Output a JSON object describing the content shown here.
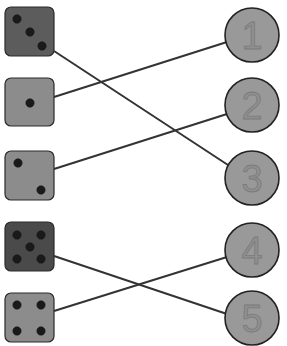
{
  "colors": {
    "die_dark": "#4a4a4a",
    "die_medium": "#5c5c5c",
    "die_light": "#8c8c8c",
    "circle_fill": "#999999",
    "line": "#333333"
  },
  "dice": [
    {
      "pips": 3,
      "fill": "#5c5c5c",
      "x": 5,
      "y": 7
    },
    {
      "pips": 1,
      "fill": "#8c8c8c",
      "x": 5,
      "y": 78
    },
    {
      "pips": 2,
      "fill": "#8c8c8c",
      "x": 5,
      "y": 151
    },
    {
      "pips": 5,
      "fill": "#4a4a4a",
      "x": 5,
      "y": 222
    },
    {
      "pips": 4,
      "fill": "#8c8c8c",
      "x": 5,
      "y": 293
    }
  ],
  "numbers": [
    {
      "label": "1",
      "cx": 252,
      "cy": 35
    },
    {
      "label": "2",
      "cx": 252,
      "cy": 105
    },
    {
      "label": "3",
      "cx": 252,
      "cy": 178
    },
    {
      "label": "4",
      "cx": 252,
      "cy": 250
    },
    {
      "label": "5",
      "cx": 252,
      "cy": 318
    }
  ],
  "connections": [
    {
      "from_die_pips": 3,
      "to_number": "3"
    },
    {
      "from_die_pips": 1,
      "to_number": "1"
    },
    {
      "from_die_pips": 2,
      "to_number": "2"
    },
    {
      "from_die_pips": 5,
      "to_number": "5"
    },
    {
      "from_die_pips": 4,
      "to_number": "4"
    }
  ]
}
